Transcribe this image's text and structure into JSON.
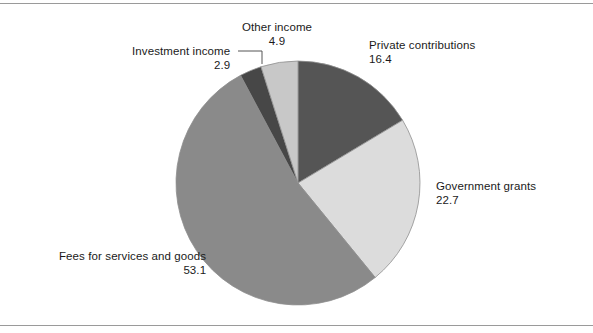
{
  "chart_data": {
    "type": "pie",
    "title": "",
    "subtitle": "",
    "xlabel": "",
    "ylabel": "",
    "legend_position": "none",
    "grid": false,
    "total": 100.0,
    "units": "percent",
    "start_angle_deg": 0,
    "direction": "clockwise",
    "categories": [
      "Private contributions",
      "Government grants",
      "Fees for services and goods",
      "Investment income",
      "Other income"
    ],
    "values": [
      16.4,
      22.7,
      53.1,
      2.9,
      4.9
    ],
    "slices": [
      {
        "label": "Private contributions",
        "value": "16.4",
        "number": 16.4,
        "color": "#555555",
        "start_deg": 0.0,
        "end_deg": 59.04
      },
      {
        "label": "Government grants",
        "value": "22.7",
        "number": 22.7,
        "color": "#dcdcdc",
        "start_deg": 59.04,
        "end_deg": 140.76
      },
      {
        "label": "Fees for services and goods",
        "value": "53.1",
        "number": 53.1,
        "color": "#8a8a8a",
        "start_deg": 140.76,
        "end_deg": 331.92
      },
      {
        "label": "Investment income",
        "value": "2.9",
        "number": 2.9,
        "color": "#474747",
        "start_deg": 331.92,
        "end_deg": 342.36
      },
      {
        "label": "Other income",
        "value": "4.9",
        "number": 4.9,
        "color": "#c8c8c8",
        "start_deg": 342.36,
        "end_deg": 360.0
      }
    ]
  },
  "geometry": {
    "center_x": 298,
    "center_y": 183,
    "radius": 122
  },
  "colors": {
    "background": "#ffffff",
    "frame_rule": "#9a9a9a",
    "slice_outline": "#8f8f8f",
    "leader_line": "#555555",
    "text": "#1a1a1a"
  }
}
